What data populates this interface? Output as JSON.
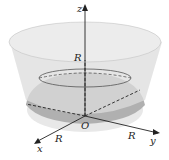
{
  "figure": {
    "axes": {
      "z_label": "z",
      "x_label": "x",
      "y_label": "y",
      "origin_label": "O"
    },
    "radius_labels": {
      "z": "R",
      "x": "R",
      "y": "R"
    },
    "colors": {
      "cone_fill": "#d9d9d9",
      "sphere_fill": "#a8a8a8",
      "sphere_base": "#e6e6e6",
      "axis": "#222222"
    }
  }
}
